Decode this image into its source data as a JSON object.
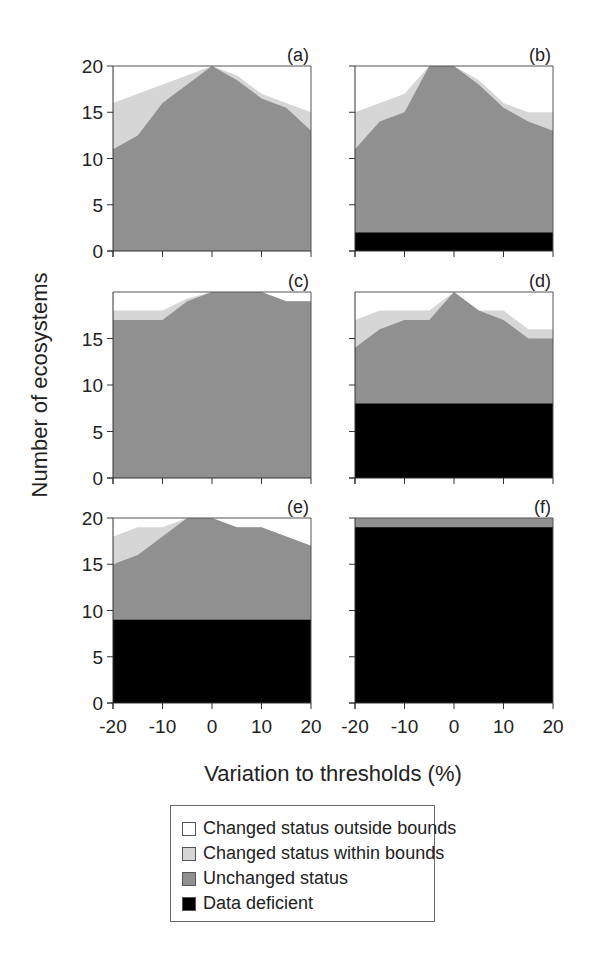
{
  "chart_data": {
    "type": "area",
    "stacked": true,
    "xlabel": "Variation to thresholds (%)",
    "ylabel": "Number of ecosystems",
    "x": [
      -20,
      -15,
      -10,
      -5,
      0,
      5,
      10,
      15,
      20
    ],
    "x_ticks": [
      -20,
      -10,
      0,
      10,
      20
    ],
    "ylim": [
      0,
      20
    ],
    "legend": [
      {
        "name": "Changed status outside bounds",
        "color": "#ffffff"
      },
      {
        "name": "Changed status within bounds",
        "color": "#d6d6d6"
      },
      {
        "name": "Unchanged status",
        "color": "#909090"
      },
      {
        "name": "Data deficient",
        "color": "#000000"
      }
    ],
    "panels": [
      {
        "label": "(a)",
        "y_ticks": [
          0,
          5,
          10,
          15,
          20
        ],
        "data_deficient": [
          0,
          0,
          0,
          0,
          0,
          0,
          0,
          0,
          0
        ],
        "unchanged_cumulative": [
          11,
          12.5,
          16,
          18,
          20,
          18.5,
          16.5,
          15.5,
          13
        ],
        "within_cumulative": [
          16,
          17,
          18,
          19,
          20,
          19,
          17,
          16,
          15
        ]
      },
      {
        "label": "(b)",
        "y_ticks": [
          0,
          5,
          10,
          15,
          20
        ],
        "data_deficient": [
          2,
          2,
          2,
          2,
          2,
          2,
          2,
          2,
          2
        ],
        "unchanged_cumulative": [
          11,
          14,
          15,
          20,
          20,
          18,
          15.5,
          14,
          13
        ],
        "within_cumulative": [
          15,
          16,
          17,
          20,
          20,
          18.5,
          16,
          15,
          15
        ]
      },
      {
        "label": "(c)",
        "y_ticks": [
          0,
          5,
          10,
          15
        ],
        "data_deficient": [
          0,
          0,
          0,
          0,
          0,
          0,
          0,
          0,
          0
        ],
        "unchanged_cumulative": [
          17,
          17,
          17,
          19,
          20,
          20,
          20,
          19,
          19
        ],
        "within_cumulative": [
          18,
          18,
          18,
          19.3,
          20,
          20,
          20,
          19,
          19
        ]
      },
      {
        "label": "(d)",
        "y_ticks": [
          0,
          5,
          10,
          15
        ],
        "data_deficient": [
          8,
          8,
          8,
          8,
          8,
          8,
          8,
          8,
          8
        ],
        "unchanged_cumulative": [
          14,
          16,
          17,
          17,
          20,
          18,
          17,
          15,
          15
        ],
        "within_cumulative": [
          17,
          18,
          18,
          18,
          20,
          18,
          18,
          16,
          16
        ]
      },
      {
        "label": "(e)",
        "y_ticks": [
          0,
          5,
          10,
          15,
          20
        ],
        "data_deficient": [
          9,
          9,
          9,
          9,
          9,
          9,
          9,
          9,
          9
        ],
        "unchanged_cumulative": [
          15,
          16,
          18,
          20,
          20,
          19,
          19,
          18,
          17
        ],
        "within_cumulative": [
          18,
          19,
          19,
          20,
          20,
          19,
          19,
          18,
          17
        ]
      },
      {
        "label": "(f)",
        "y_ticks": [
          0,
          5,
          10,
          15,
          20
        ],
        "data_deficient": [
          19,
          19,
          19,
          19,
          19,
          19,
          19,
          19,
          19
        ],
        "unchanged_cumulative": [
          20,
          20,
          20,
          20,
          20,
          20,
          20,
          20,
          20
        ],
        "within_cumulative": [
          20,
          20,
          20,
          20,
          20,
          20,
          20,
          20,
          20
        ]
      }
    ]
  },
  "layout": {
    "columns_x": [
      [
        113,
        311
      ],
      [
        355,
        553
      ]
    ],
    "rows_y": [
      [
        66,
        251
      ],
      [
        292,
        478
      ],
      [
        518,
        703
      ]
    ],
    "show_ytick_labels": [
      true,
      false,
      true,
      false,
      true,
      false
    ],
    "show_xtick_labels": [
      false,
      false,
      false,
      false,
      true,
      true
    ]
  },
  "labels": {
    "ylabel": "Number of ecosystems",
    "xlabel": "Variation to thresholds (%)",
    "legend_0": "Changed status outside bounds",
    "legend_1": "Changed status within bounds",
    "legend_2": "Unchanged status",
    "legend_3": "Data deficient"
  }
}
